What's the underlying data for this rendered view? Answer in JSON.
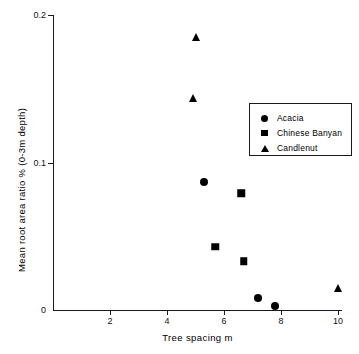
{
  "chart_data": {
    "type": "scatter",
    "title": "",
    "xlabel": "Tree spacing  m",
    "ylabel": "Mean root area ratio  % (0-3m depth)",
    "xlim": [
      0,
      10.15
    ],
    "ylim": [
      0,
      0.2
    ],
    "xticks": [
      2,
      4,
      6,
      8,
      10
    ],
    "xtick_labels": [
      "2",
      "4",
      "6",
      "8",
      "10"
    ],
    "yticks": [
      0,
      0.1,
      0.2
    ],
    "ytick_labels": [
      "0",
      "0.1",
      "0.2"
    ],
    "grid": false,
    "legend_position": "upper right",
    "series": [
      {
        "name": "Acacia",
        "marker": "circle",
        "color": "#000000",
        "points": [
          {
            "x": 5.3,
            "y": 0.087
          },
          {
            "x": 7.2,
            "y": 0.008
          },
          {
            "x": 7.8,
            "y": 0.003
          }
        ]
      },
      {
        "name": "Chinese Banyan",
        "marker": "square",
        "color": "#000000",
        "points": [
          {
            "x": 6.6,
            "y": 0.079
          },
          {
            "x": 5.7,
            "y": 0.043
          },
          {
            "x": 6.7,
            "y": 0.033
          }
        ]
      },
      {
        "name": "Candlenut",
        "marker": "triangle",
        "color": "#000000",
        "points": [
          {
            "x": 5.0,
            "y": 0.185
          },
          {
            "x": 4.9,
            "y": 0.144
          },
          {
            "x": 10.0,
            "y": 0.015
          }
        ]
      }
    ]
  },
  "axes": {
    "x_title": "Tree spacing  m",
    "y_title": "Mean root area ratio  % (0-3m depth)",
    "x_labels": [
      "2",
      "4",
      "6",
      "8",
      "10"
    ],
    "y_labels": [
      "0",
      "0.1",
      "0.2"
    ]
  },
  "legend": {
    "entries": [
      {
        "label": "Acacia",
        "marker": "circle-marker-icon"
      },
      {
        "label": "Chinese Banyan",
        "marker": "square-marker-icon"
      },
      {
        "label": "Candlenut",
        "marker": "triangle-marker-icon"
      }
    ]
  }
}
